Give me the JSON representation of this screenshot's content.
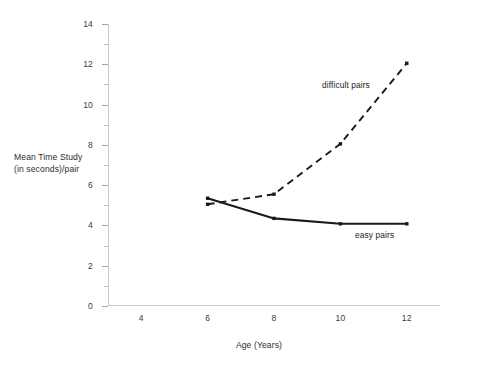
{
  "chart_data": {
    "type": "line",
    "title": "",
    "xlabel": "Age (Years)",
    "ylabel_line1": "Mean Time Study",
    "ylabel_line2": "(in seconds)/pair",
    "x": [
      6,
      8,
      10,
      12
    ],
    "xlim": [
      3,
      13
    ],
    "ylim": [
      0,
      14
    ],
    "xticks": [
      4,
      6,
      8,
      10,
      12
    ],
    "yticks": [
      0,
      2,
      4,
      6,
      8,
      10,
      12,
      14
    ],
    "yticks_minor": [
      1,
      3,
      5,
      7,
      9,
      11,
      13
    ],
    "grid": false,
    "legend": "inline-annotations",
    "series": [
      {
        "name": "easy pairs",
        "style": "solid",
        "color": "#1a1a1a",
        "values": [
          5.35,
          4.35,
          4.08,
          4.08
        ]
      },
      {
        "name": "difficult pairs",
        "style": "dashed",
        "color": "#1a1a1a",
        "values": [
          5.05,
          5.55,
          8.05,
          12.05
        ]
      }
    ],
    "annotations": [
      {
        "text": "difficult pairs",
        "x": 10.2,
        "y": 9.9
      },
      {
        "text": "easy pairs",
        "x": 10.9,
        "y": 3.0
      }
    ]
  },
  "axes": {
    "x_tick_labels": [
      "4",
      "6",
      "8",
      "10",
      "12"
    ],
    "y_tick_labels": [
      "0",
      "2",
      "4",
      "6",
      "8",
      "10",
      "12",
      "14"
    ]
  }
}
